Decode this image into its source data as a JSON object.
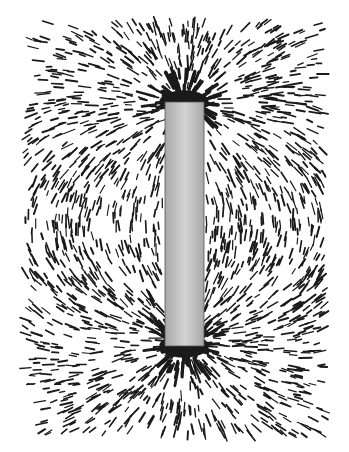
{
  "image": {
    "subject": "Iron filings aligned around a vertical bar magnet",
    "width": 349,
    "height": 452,
    "background": "#ffffff"
  },
  "magnet": {
    "x": 165,
    "y": 102,
    "width": 39,
    "height": 244,
    "fill_edge": "#a8a8a8",
    "fill_center": "#d4d4d4",
    "stroke": "#555555"
  },
  "filings": {
    "color": "#1a1a1a",
    "region": {
      "x0": 25,
      "y0": 22,
      "x1": 325,
      "y1": 436
    },
    "seed": 7,
    "count": 1700,
    "min_len": 5,
    "max_len": 13,
    "stroke_width": 1.6,
    "pole_clusters": [
      {
        "x": 184,
        "y": 102,
        "radius": 26
      },
      {
        "x": 184,
        "y": 346,
        "radius": 26
      }
    ]
  }
}
